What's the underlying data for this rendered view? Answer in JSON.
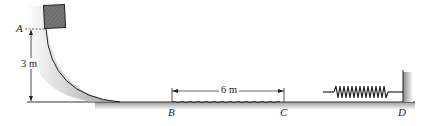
{
  "diagram": {
    "points": [
      {
        "id": "A",
        "label": "A"
      },
      {
        "id": "B",
        "label": "B"
      },
      {
        "id": "C",
        "label": "C"
      },
      {
        "id": "D",
        "label": "D"
      }
    ],
    "dimensions": {
      "height": "3 m",
      "rough_length": "6 m"
    },
    "elements": [
      "block",
      "curved-ramp",
      "rough-section",
      "spring",
      "wall"
    ]
  }
}
